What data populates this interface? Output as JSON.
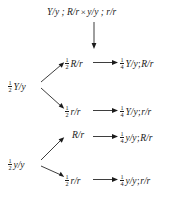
{
  "diagram": {
    "title_cross": {
      "parent1": "Y/y ; R/r",
      "operator": "×",
      "parent2": "y/y ; r/r",
      "full": "Y/y ; R/r × y/y ; r/r"
    },
    "first_branch_labels": [
      {
        "fraction_num": "1",
        "fraction_den": "2",
        "genotype": "Y/y"
      },
      {
        "fraction_num": "1",
        "fraction_den": "2",
        "genotype": "y/y"
      }
    ],
    "second_branch_labels": [
      {
        "fraction_num": "1",
        "fraction_den": "2",
        "genotype": "R/r"
      },
      {
        "fraction_num": "1",
        "fraction_den": "2",
        "genotype": "r/r"
      },
      {
        "fraction_num": "",
        "fraction_den": "",
        "genotype": "R/r"
      },
      {
        "fraction_num": "1",
        "fraction_den": "2",
        "genotype": "r/r"
      }
    ],
    "outcomes": [
      {
        "fraction_num": "1",
        "fraction_den": "4",
        "genotype_left": "Y/y",
        "separator": ";",
        "genotype_right": "R/r"
      },
      {
        "fraction_num": "1",
        "fraction_den": "4",
        "genotype_left": "Y/y",
        "separator": ";",
        "genotype_right": "r/r"
      },
      {
        "fraction_num": "1",
        "fraction_den": "4",
        "genotype_left": "y/y",
        "separator": ";",
        "genotype_right": "R/r"
      },
      {
        "fraction_num": "1",
        "fraction_den": "4",
        "genotype_left": "y/y",
        "separator": ";",
        "genotype_right": "r/r"
      }
    ],
    "colors": {
      "background": "#ffffff",
      "ink": "#1b1b1b"
    }
  }
}
